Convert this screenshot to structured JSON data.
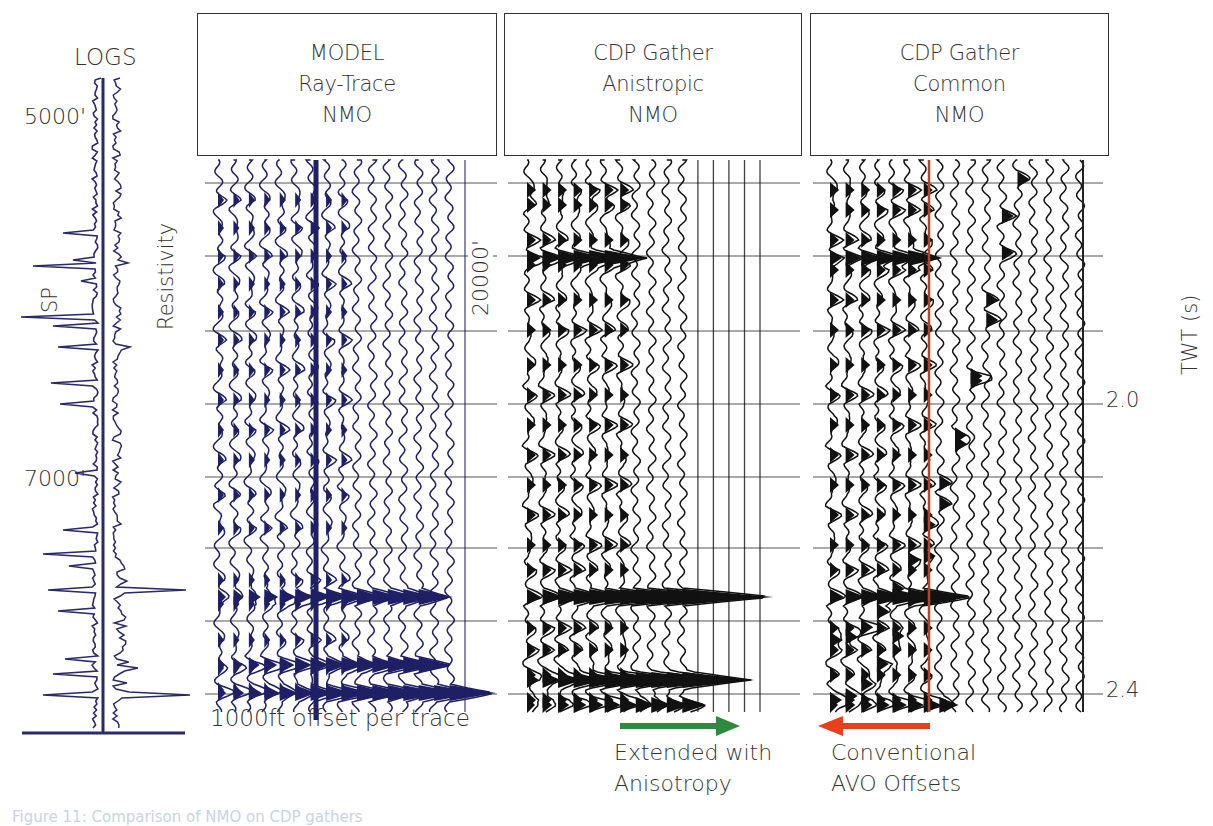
{
  "logs": {
    "title": "LOGS",
    "depth_labels": [
      {
        "text": "5000'",
        "y": 128
      },
      {
        "text": "7000'",
        "y": 480
      }
    ],
    "sp_label": "SP",
    "resistivity_label": "Resistivity",
    "color": "#2a2a6a"
  },
  "panels": [
    {
      "id": "model",
      "lines": [
        "MODEL",
        "Ray-Trace",
        "NMO"
      ],
      "trace_color": "#1f1f66",
      "marker_line_color": "#1f1f66"
    },
    {
      "id": "anisotropic",
      "lines": [
        "CDP Gather",
        "Anistropic",
        "NMO"
      ],
      "trace_color": "#111111"
    },
    {
      "id": "common",
      "lines": [
        "CDP Gather",
        "Common",
        "NMO"
      ],
      "trace_color": "#111111",
      "marker_line_color": "#b5442e"
    }
  ],
  "annotations": {
    "offset_label": "1000ft offset per trace",
    "distance_label": "20000'",
    "green_arrow": {
      "direction": "right",
      "color": "#2e8b3e",
      "lines": [
        "Extended with",
        "Anisotropy"
      ]
    },
    "red_arrow": {
      "direction": "left",
      "color": "#e8401c",
      "lines": [
        "Conventional",
        "AVO Offsets"
      ]
    }
  },
  "axis": {
    "title": "TWT (s)",
    "ticks": [
      {
        "label": "2.0",
        "y": 404
      },
      {
        "label": "2.4",
        "y": 694
      }
    ]
  },
  "caption": "Figure 11: Comparison of NMO on CDP gathers",
  "chart_data": {
    "type": "table",
    "panels": [
      "LOGS",
      "MODEL Ray-Trace NMO",
      "CDP Gather Anistropic NMO",
      "CDP Gather Common NMO"
    ],
    "ylabel": "TWT (s)",
    "y_ticks_labeled": [
      2.0,
      2.4
    ],
    "gridline_twt": [
      1.7,
      1.8,
      1.9,
      2.0,
      2.1,
      2.2,
      2.3,
      2.4
    ],
    "log_depths": [
      "5000'",
      "7000'"
    ],
    "offset_spacing": "1000ft offset per trace",
    "max_offset": "20000'",
    "annotations": [
      "Extended with Anisotropy",
      "Conventional AVO Offsets"
    ]
  }
}
